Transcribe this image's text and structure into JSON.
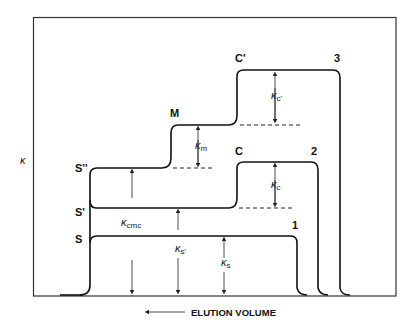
{
  "diagram": {
    "y_axis_label": "κ",
    "x_axis_label": "ELUTION VOLUME",
    "x_axis_arrow": "left-arrow",
    "curves": [
      {
        "id": "1",
        "label": "1"
      },
      {
        "id": "2",
        "label": "2"
      },
      {
        "id": "3",
        "label": "3"
      }
    ],
    "point_labels": {
      "S": "S",
      "S_prime": "S'",
      "S_double_prime": "S''",
      "M": "M",
      "C": "C",
      "C_prime": "C'"
    },
    "kappa_labels": {
      "cmc": {
        "symbol": "κ",
        "sub": "cmc"
      },
      "s_prime": {
        "symbol": "κ",
        "sub": "s'"
      },
      "s": {
        "symbol": "κ",
        "sub": "s"
      },
      "m": {
        "symbol": "κ",
        "sub": "m"
      },
      "c": {
        "symbol": "κ",
        "sub": "c"
      },
      "c_prime": {
        "symbol": "κ",
        "sub": "c'"
      }
    }
  }
}
